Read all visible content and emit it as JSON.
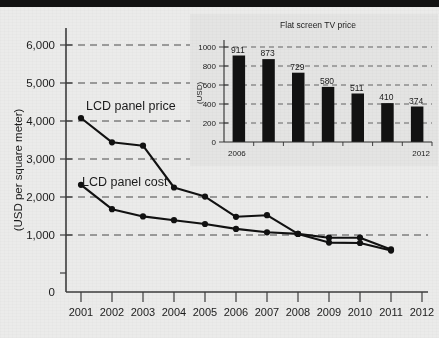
{
  "chart_data": [
    {
      "type": "line",
      "id": "main",
      "title": "",
      "xlabel": "",
      "ylabel": "(USD per square meter)",
      "xlim": [
        2000.5,
        2012.5
      ],
      "ylim": [
        0,
        6400
      ],
      "yticks": [
        0,
        1000,
        2000,
        3000,
        4000,
        5000,
        6000
      ],
      "ytick_labels": [
        "0",
        "1,000",
        "2,000",
        "3,000",
        "4,000",
        "5,000",
        "6,000"
      ],
      "x": [
        2001,
        2002,
        2003,
        2004,
        2005,
        2006,
        2007,
        2008,
        2009,
        2010,
        2011
      ],
      "xtick_labels": [
        "2001",
        "2002",
        "2003",
        "2004",
        "2005",
        "2006",
        "2007",
        "2008",
        "2009",
        "2010",
        "2011",
        "2012"
      ],
      "grid": "horizontal-dashed",
      "legend": "inline-labels",
      "series": [
        {
          "name": "LCD panel price",
          "label": "LCD panel price",
          "values": [
            4080,
            3440,
            3350,
            2250,
            2010,
            1480,
            1520,
            1030,
            930,
            930,
            620
          ]
        },
        {
          "name": "LCD panel cost",
          "label": "LCD panel cost",
          "values": [
            2320,
            1680,
            1490,
            1390,
            1290,
            1160,
            1070,
            1030,
            800,
            790,
            590
          ]
        }
      ]
    },
    {
      "type": "bar",
      "id": "inset",
      "title": "Flat screen TV price",
      "xlabel": "",
      "ylabel": "(USD)",
      "ylim": [
        0,
        1080
      ],
      "yticks": [
        0,
        200,
        400,
        600,
        800,
        1000
      ],
      "ytick_labels": [
        "0",
        "200",
        "400",
        "600",
        "800",
        "1000"
      ],
      "categories": [
        "2006",
        "2007",
        "2008",
        "2009",
        "2010",
        "2011",
        "2012"
      ],
      "xtick_labels_shown": [
        "2006",
        "2012"
      ],
      "values": [
        911,
        873,
        729,
        580,
        511,
        410,
        374
      ],
      "value_labels": [
        "911",
        "873",
        "729",
        "580",
        "511",
        "410",
        "374"
      ],
      "grid": "horizontal-dashed"
    }
  ],
  "main_chart": {
    "y_axis_title": "(USD per square meter)",
    "ytick_labels": [
      "6,000",
      "5,000",
      "4,000",
      "3,000",
      "2,000",
      "1,000",
      "0"
    ],
    "xtick_labels": [
      "2001",
      "2002",
      "2003",
      "2004",
      "2005",
      "2006",
      "2007",
      "2008",
      "2009",
      "2010",
      "2011",
      "2012"
    ],
    "series_label_price": "LCD panel price",
    "series_label_cost": "LCD panel cost"
  },
  "inset_chart": {
    "title": "Flat screen TV price",
    "y_axis_title": "(USD)",
    "ytick_labels": [
      "1000",
      "800",
      "600",
      "400",
      "200",
      "0"
    ],
    "x_label_start": "2006",
    "x_label_end": "2012",
    "bar_labels": [
      "911",
      "873",
      "729",
      "580",
      "511",
      "410",
      "374"
    ]
  },
  "colors": {
    "background": "#ebebea",
    "inset_background": "#e4e4e3",
    "line": "#111111",
    "bar": "#121212",
    "grid": "#4a4a4a",
    "top_bar": "#121212"
  }
}
